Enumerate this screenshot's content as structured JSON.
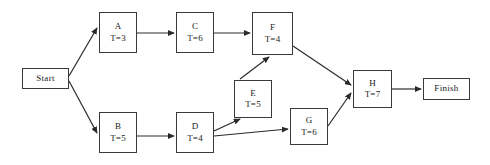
{
  "diagram": {
    "type": "project-network-diagram",
    "notation": "activity-on-node",
    "duration_prefix": "T=",
    "line_color": "#3a3a3a",
    "background_color": "#ffffff",
    "text_color": "#1a1a1a",
    "terminals": {
      "start": {
        "label": "Start",
        "x": 22,
        "y": 68,
        "w": 47,
        "h": 21
      },
      "finish": {
        "label": "Finish",
        "x": 423,
        "y": 78,
        "w": 47,
        "h": 22
      }
    },
    "nodes": [
      {
        "key": "A",
        "id": "A",
        "duration": "T=3",
        "duration_value": 3,
        "x": 99,
        "y": 12,
        "w": 38,
        "h": 41
      },
      {
        "key": "C",
        "id": "C",
        "duration": "T=6",
        "duration_value": 6,
        "x": 176,
        "y": 12,
        "w": 38,
        "h": 41
      },
      {
        "key": "F",
        "id": "F",
        "duration": "T=4",
        "duration_value": 4,
        "x": 252,
        "y": 12,
        "w": 41,
        "h": 43
      },
      {
        "key": "B",
        "id": "B",
        "duration": "T=5",
        "duration_value": 5,
        "x": 99,
        "y": 112,
        "w": 38,
        "h": 41
      },
      {
        "key": "D",
        "id": "D",
        "duration": "T=4",
        "duration_value": 4,
        "x": 176,
        "y": 112,
        "w": 38,
        "h": 41
      },
      {
        "key": "E",
        "id": "E",
        "duration": "T=5",
        "duration_value": 5,
        "x": 234,
        "y": 80,
        "w": 38,
        "h": 38
      },
      {
        "key": "G",
        "id": "G",
        "duration": "T=6",
        "duration_value": 6,
        "x": 290,
        "y": 108,
        "w": 38,
        "h": 37
      },
      {
        "key": "H",
        "id": "H",
        "duration": "T=7",
        "duration_value": 7,
        "x": 353,
        "y": 70,
        "w": 39,
        "h": 38
      }
    ],
    "edges": [
      {
        "from": "Start",
        "to": "A",
        "x1": 69,
        "y1": 76,
        "x2": 97,
        "y2": 28
      },
      {
        "from": "Start",
        "to": "B",
        "x1": 69,
        "y1": 81,
        "x2": 97,
        "y2": 133
      },
      {
        "from": "A",
        "to": "C",
        "x1": 137,
        "y1": 33,
        "x2": 174,
        "y2": 33
      },
      {
        "from": "C",
        "to": "F",
        "x1": 214,
        "y1": 33,
        "x2": 250,
        "y2": 33
      },
      {
        "from": "B",
        "to": "D",
        "x1": 137,
        "y1": 136,
        "x2": 174,
        "y2": 136
      },
      {
        "from": "D",
        "to": "E",
        "x1": 214,
        "y1": 131,
        "x2": 240,
        "y2": 119
      },
      {
        "from": "D",
        "to": "G",
        "x1": 214,
        "y1": 136,
        "x2": 288,
        "y2": 129
      },
      {
        "from": "E",
        "to": "F",
        "x1": 240,
        "y1": 79,
        "x2": 269,
        "y2": 57
      },
      {
        "from": "F",
        "to": "H",
        "x1": 293,
        "y1": 46,
        "x2": 351,
        "y2": 85
      },
      {
        "from": "G",
        "to": "H",
        "x1": 328,
        "y1": 126,
        "x2": 351,
        "y2": 93
      },
      {
        "from": "H",
        "to": "Finish",
        "x1": 392,
        "y1": 89,
        "x2": 421,
        "y2": 89
      }
    ]
  }
}
